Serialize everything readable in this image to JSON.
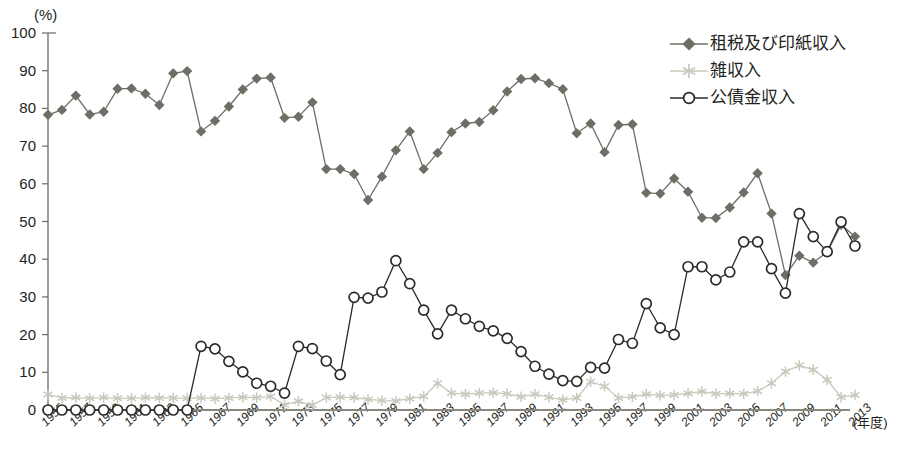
{
  "chart_data": {
    "type": "line",
    "title": "",
    "xlabel": "(年度)",
    "ylabel": "(%)",
    "ylim": [
      0,
      100
    ],
    "ytick_step": 10,
    "yticks": [
      "100",
      "90",
      "80",
      "70",
      "60",
      "50",
      "40",
      "30",
      "20",
      "10",
      "0"
    ],
    "grid": false,
    "legend_position": "top-right",
    "x": [
      1955,
      1956,
      1957,
      1958,
      1959,
      1960,
      1961,
      1962,
      1963,
      1964,
      1965,
      1966,
      1967,
      1968,
      1969,
      1970,
      1971,
      1972,
      1973,
      1974,
      1975,
      1976,
      1977,
      1978,
      1979,
      1980,
      1981,
      1982,
      1983,
      1984,
      1985,
      1986,
      1987,
      1988,
      1989,
      1990,
      1991,
      1992,
      1993,
      1994,
      1995,
      1996,
      1997,
      1998,
      1999,
      2000,
      2001,
      2002,
      2003,
      2004,
      2005,
      2006,
      2007,
      2008,
      2009,
      2010,
      2011,
      2012,
      2013
    ],
    "tick_labels": [
      "1955",
      "1957",
      "1959",
      "1961",
      "1963",
      "1965",
      "1967",
      "1969",
      "1971",
      "1973",
      "1975",
      "1977",
      "1979",
      "1981",
      "1983",
      "1985",
      "1987",
      "1989",
      "1991",
      "1993",
      "1995",
      "1997",
      "1999",
      "2001",
      "2003",
      "2005",
      "2007",
      "2009",
      "2011",
      "2013"
    ],
    "tick_label_step_years": 2,
    "series": [
      {
        "name": "租税及び印紙収入",
        "marker": "filled-diamond",
        "color": "#6e6e66",
        "values": [
          78.3,
          79.6,
          83.4,
          78.4,
          79.1,
          85.2,
          85.3,
          83.9,
          80.9,
          89.3,
          89.9,
          73.9,
          76.7,
          80.5,
          85.0,
          87.9,
          88.2,
          77.5,
          77.8,
          81.6,
          63.9,
          63.9,
          62.6,
          55.7,
          61.9,
          68.9,
          73.9,
          63.9,
          68.2,
          73.7,
          76.0,
          76.4,
          79.5,
          84.5,
          87.8,
          88.0,
          86.7,
          85.1,
          73.4,
          76.0,
          68.4,
          75.6,
          75.8,
          57.6,
          57.4,
          61.4,
          57.9,
          51.0,
          50.9,
          53.7,
          57.7,
          62.8,
          52.1,
          35.8,
          40.9,
          39.1,
          41.9,
          49.1,
          46.0
        ]
      },
      {
        "name": "雑収入",
        "marker": "asterisk",
        "color": "#c8c8bd",
        "values": [
          4.1,
          3.2,
          3.3,
          3.1,
          3.3,
          3.1,
          3.1,
          3.3,
          3.2,
          3.2,
          3.1,
          3.2,
          3.0,
          3.2,
          3.4,
          3.3,
          3.6,
          1.4,
          2.3,
          1.3,
          3.3,
          3.4,
          3.3,
          2.8,
          2.5,
          2.4,
          3.0,
          3.6,
          7.1,
          4.5,
          4.2,
          4.5,
          4.6,
          4.3,
          3.5,
          4.2,
          3.4,
          2.7,
          3.2,
          7.5,
          6.3,
          3.2,
          3.5,
          4.2,
          3.9,
          4.0,
          4.4,
          4.9,
          4.3,
          4.4,
          4.3,
          5.0,
          7.1,
          10.2,
          11.8,
          10.7,
          8.0,
          3.4,
          4.0
        ]
      },
      {
        "name": "公債金収入",
        "marker": "open-circle",
        "color": "#2c2b28",
        "values": [
          0,
          0,
          0,
          0,
          0,
          0,
          0,
          0,
          0,
          0,
          0,
          16.9,
          16.2,
          12.9,
          10.1,
          7.1,
          6.3,
          4.5,
          16.9,
          16.3,
          13.0,
          9.4,
          29.9,
          29.7,
          31.3,
          39.6,
          33.5,
          26.5,
          20.2,
          26.5,
          24.2,
          22.2,
          21.0,
          19.0,
          15.5,
          11.6,
          9.5,
          7.8,
          7.6,
          11.3,
          11.1,
          18.7,
          17.7,
          28.2,
          21.8,
          20.0,
          38.0,
          38.0,
          34.5,
          36.6,
          44.6,
          44.6,
          37.5,
          31.0,
          52.1,
          46.0,
          42.0,
          49.9,
          43.5
        ]
      }
    ]
  },
  "axis": {
    "y_unit": "(%)",
    "x_title": "(年度)"
  },
  "legend": {
    "items": [
      {
        "label": "租税及び印紙収入",
        "marker": "filled-diamond",
        "color": "#6e6e66"
      },
      {
        "label": "雑収入",
        "marker": "asterisk",
        "color": "#c8c8bd"
      },
      {
        "label": "公債金収入",
        "marker": "open-circle",
        "color": "#2c2b28"
      }
    ]
  }
}
